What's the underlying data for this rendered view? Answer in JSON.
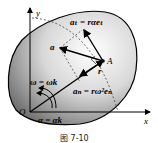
{
  "figure": {
    "caption": "图 7-10",
    "labels": {
      "y_axis": "y",
      "x_axis": "x",
      "origin": "O",
      "point": "A",
      "position_vector": "r",
      "acceleration": "a",
      "tangential_accel": "aₜ = rαeₜ",
      "normal_accel": "aₙ = rω²eₙ",
      "angular_velocity": "ω = ωk",
      "angular_accel": "α = αk"
    },
    "colors": {
      "body_light": "#ffffff",
      "body_dark": "#6a6a6a",
      "stroke": "#000000"
    }
  }
}
